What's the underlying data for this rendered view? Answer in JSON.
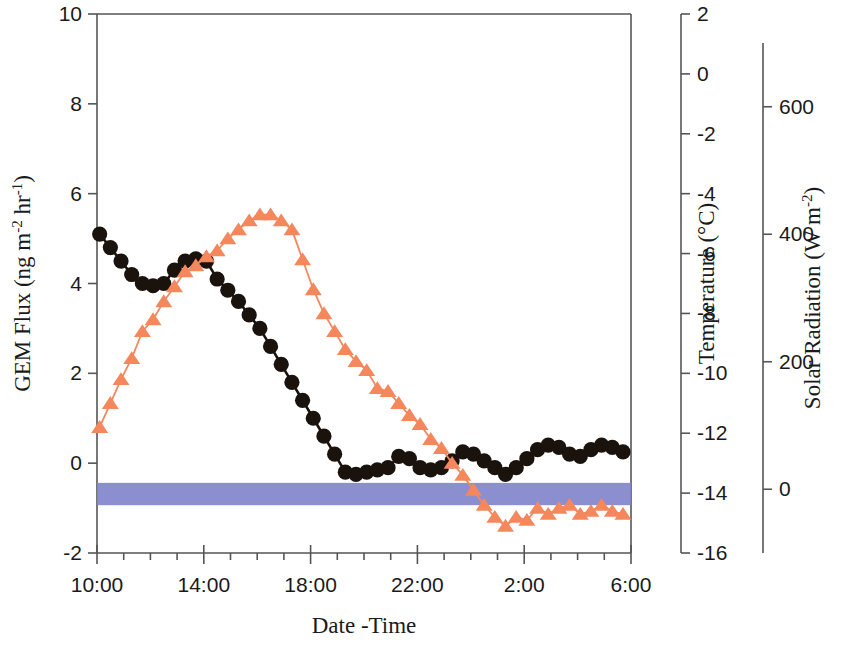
{
  "chart_data": {
    "type": "line",
    "title": "",
    "xlabel": "Date -Time",
    "x_tick_labels": [
      "10:00",
      "14:00",
      "18:00",
      "22:00",
      "2:00",
      "6:00"
    ],
    "x_tick_hours": [
      10,
      14,
      18,
      22,
      26,
      30
    ],
    "x_range_hours": [
      10,
      30
    ],
    "x_minor_tick_step_hours": 1,
    "axes": [
      {
        "id": "left",
        "label": "GEM Flux (ng m",
        "label_sup1": "-2",
        "label_mid": " hr",
        "label_sup2": "-1",
        "label_end": ")",
        "ticks": [
          10,
          8,
          6,
          4,
          2,
          0,
          -2
        ],
        "range": [
          -2,
          10
        ]
      },
      {
        "id": "right-temperature",
        "label": "Temperature (°C)",
        "ticks": [
          2,
          0,
          -2,
          -4,
          -6,
          -8,
          -10,
          -12,
          -14,
          -16
        ],
        "range": [
          -16,
          2
        ]
      },
      {
        "id": "right-solar",
        "label": "Solar Radiation (W m",
        "label_sup": "-2",
        "label_end": ")",
        "ticks": [
          600,
          400,
          200,
          0
        ],
        "range": [
          -100,
          700
        ]
      }
    ],
    "legend": {
      "visible": false,
      "position": "none"
    },
    "grid": false,
    "series": [
      {
        "name": "GEM Flux",
        "axis": "left",
        "marker": "circle",
        "color": "#1a120d",
        "line_color": "#1a120d",
        "x": [
          10.1,
          10.5,
          10.9,
          11.3,
          11.7,
          12.1,
          12.5,
          12.9,
          13.3,
          13.7,
          14.1,
          14.5,
          14.9,
          15.3,
          15.7,
          16.1,
          16.5,
          16.9,
          17.3,
          17.7,
          18.1,
          18.5,
          18.9,
          19.3,
          19.7,
          20.1,
          20.5,
          20.9,
          21.3,
          21.7,
          22.1,
          22.5,
          22.9,
          23.3,
          23.7,
          24.1,
          24.5,
          24.9,
          25.3,
          25.7,
          26.1,
          26.5,
          26.9,
          27.3,
          27.7,
          28.1,
          28.5,
          28.9,
          29.3,
          29.7
        ],
        "y": [
          5.1,
          4.8,
          4.5,
          4.2,
          4.0,
          3.95,
          4.0,
          4.3,
          4.5,
          4.55,
          4.5,
          4.1,
          3.85,
          3.6,
          3.3,
          3.0,
          2.6,
          2.2,
          1.8,
          1.4,
          1.0,
          0.6,
          0.2,
          -0.2,
          -0.25,
          -0.2,
          -0.15,
          -0.1,
          0.15,
          0.1,
          -0.1,
          -0.15,
          -0.1,
          0.05,
          0.25,
          0.2,
          0.05,
          -0.1,
          -0.25,
          -0.1,
          0.1,
          0.3,
          0.4,
          0.35,
          0.2,
          0.15,
          0.3,
          0.4,
          0.35,
          0.25
        ]
      },
      {
        "name": "Temperature",
        "axis": "right-temperature",
        "marker": "triangle",
        "color": "#f5875c",
        "line_color": "#f5875c",
        "x": [
          10.1,
          10.5,
          10.9,
          11.3,
          11.7,
          12.1,
          12.5,
          12.9,
          13.3,
          13.7,
          14.1,
          14.5,
          14.9,
          15.3,
          15.7,
          16.1,
          16.5,
          16.9,
          17.3,
          17.7,
          18.1,
          18.5,
          18.9,
          19.3,
          19.7,
          20.1,
          20.5,
          20.9,
          21.3,
          21.7,
          22.1,
          22.5,
          22.9,
          23.3,
          23.7,
          24.1,
          24.5,
          24.9,
          25.3,
          25.7,
          26.1,
          26.5,
          26.9,
          27.3,
          27.7,
          28.1,
          28.5,
          28.9,
          29.3,
          29.7
        ],
        "y": [
          -11.8,
          -11.0,
          -10.2,
          -9.5,
          -8.6,
          -8.2,
          -7.6,
          -7.1,
          -6.6,
          -6.4,
          -6.1,
          -5.9,
          -5.5,
          -5.2,
          -4.9,
          -4.7,
          -4.7,
          -4.9,
          -5.2,
          -6.2,
          -7.2,
          -8.0,
          -8.6,
          -9.2,
          -9.6,
          -9.9,
          -10.5,
          -10.6,
          -11.0,
          -11.4,
          -11.7,
          -12.2,
          -12.5,
          -13.0,
          -13.4,
          -13.9,
          -14.4,
          -14.8,
          -15.1,
          -14.8,
          -14.9,
          -14.5,
          -14.7,
          -14.5,
          -14.4,
          -14.7,
          -14.6,
          -14.4,
          -14.6,
          -14.7
        ]
      },
      {
        "name": "Solar Radiation",
        "axis": "right-solar",
        "marker": "band",
        "color": "#8186cc",
        "x_start": 10.0,
        "x_end": 30.0,
        "y_top": 10,
        "y_bottom": -25,
        "note": "flat near-zero solar radiation band spanning full record"
      }
    ]
  },
  "colors": {
    "gem_flux": "#1a120d",
    "temperature": "#f5875c",
    "solar_radiation": "#8186cc",
    "axis": "#555555",
    "text": "#1a1a1a",
    "background": "#ffffff"
  }
}
